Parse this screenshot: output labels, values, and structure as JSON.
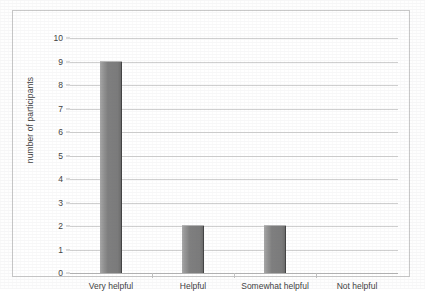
{
  "chart_data": {
    "type": "bar",
    "title": "",
    "subtitle": "",
    "categories": [
      "Very helpful",
      "Helpful",
      "Somewhat helpful",
      "Not helpful"
    ],
    "values": [
      9,
      2,
      2,
      0
    ],
    "xlabel": "",
    "ylabel": "number of participants",
    "ylim": [
      0,
      10
    ],
    "ytick_labels": [
      "0",
      "1",
      "2",
      "3",
      "4",
      "5",
      "6",
      "7",
      "8",
      "9",
      "10"
    ],
    "ytick_values": [
      0,
      1,
      2,
      3,
      4,
      5,
      6,
      7,
      8,
      9,
      10
    ],
    "grid": "horizontal",
    "legend": "none",
    "bar_color": "#7f7f7f",
    "bar_edge_color": "#2e2e2e",
    "gridline_color": "#d0d0d0",
    "axis_color": "#b4b4b4",
    "border_color": "#c9c9c9",
    "background": "#ffffff"
  },
  "figure": {
    "frame_label": "chart-outer-border"
  }
}
